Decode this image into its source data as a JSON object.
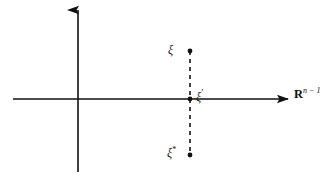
{
  "figure": {
    "width": 330,
    "height": 177,
    "background_color": "#ffffff",
    "stroke_color": "#111111",
    "caption_note": ""
  },
  "axes": {
    "vertical": {
      "name": "vertical-axis",
      "x": 78,
      "y_top": 10,
      "y_bottom": 172,
      "arrow_direction": "up",
      "stroke_width": 1.6
    },
    "horizontal": {
      "name": "horizontal-axis",
      "y": 99,
      "x_left": 13,
      "x_right": 288,
      "arrow_direction": "right",
      "stroke_width": 1.6
    }
  },
  "dashed_segment": {
    "name": "dashed-connector",
    "x": 190,
    "y_top": 51,
    "y_bottom": 155,
    "dash": "4 4",
    "stroke_width": 1.6
  },
  "points": [
    {
      "name": "point-xi",
      "x": 190,
      "y": 51,
      "radius": 2.4,
      "label": "xi"
    },
    {
      "name": "point-xi-prime",
      "x": 190,
      "y": 99,
      "radius": 2.4,
      "label": "xi-prime"
    },
    {
      "name": "point-xi-star",
      "x": 190,
      "y": 155,
      "radius": 2.4,
      "label": "xi-star"
    }
  ],
  "labels": {
    "xi": {
      "glyph": "ξ",
      "superscript": "",
      "x": 168,
      "y": 44
    },
    "xi_prime": {
      "glyph": "ξ",
      "superscript": "′",
      "x": 196,
      "y": 88
    },
    "xi_star": {
      "glyph": "ξ",
      "superscript": "*",
      "x": 167,
      "y": 146
    },
    "space": {
      "symbol": "R",
      "superscript": "n − 1",
      "x": 294,
      "y": 87
    }
  }
}
